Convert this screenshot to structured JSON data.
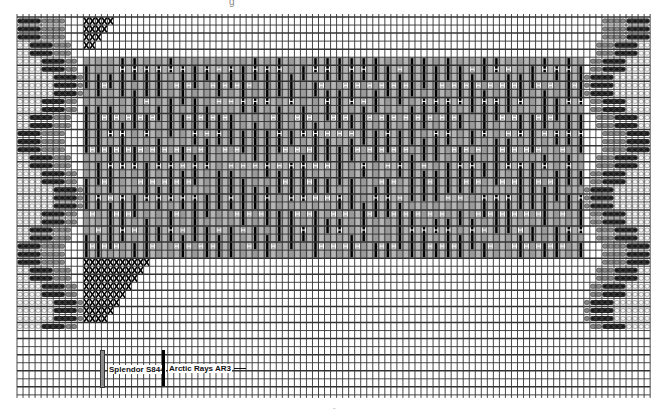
{
  "title_fragment": "g",
  "footer_fragment": "-",
  "grid": {
    "left": 17,
    "top": 17,
    "cols": 105,
    "rows": 47,
    "cell_w": 6.03,
    "cell_h": 8.04,
    "line_color": "#333333"
  },
  "colors": {
    "gray_yarn": "#8a8a8a",
    "black_yarn": "#1a1a1a",
    "white_yarn": "#f4f4f4",
    "center_fill": "#9a9a9a",
    "stitch_black": "#000000",
    "marker_white": "#ffffff"
  },
  "regions": {
    "center_block": {
      "col_start": 11,
      "col_end": 94,
      "row_start": 5,
      "row_end": 30
    },
    "top_x_block": {
      "col_start": 11,
      "col_end": 16,
      "row_start": 0,
      "row_end": 4
    },
    "bottom_x_block": {
      "col_start": 11,
      "col_end": 22,
      "row_start": 30,
      "row_end": 38
    }
  },
  "border_offsets": [
    0,
    0,
    0,
    1,
    1,
    2,
    2,
    3,
    3,
    3,
    2,
    2,
    1,
    1,
    0,
    0,
    0,
    1,
    1,
    2,
    2,
    3,
    3,
    3,
    2,
    2,
    1,
    1,
    0,
    0,
    0,
    1,
    1,
    2,
    2,
    3,
    3,
    3,
    2,
    2
  ],
  "legend": [
    {
      "label": "Splendor S844",
      "color": "#8a8a8a"
    },
    {
      "label": "Arctic Rays AR3",
      "color": "#000000"
    }
  ],
  "chart_data": {
    "type": "pattern-chart",
    "title": "",
    "legend": [
      "Splendor S844",
      "Arctic Rays AR3"
    ]
  }
}
